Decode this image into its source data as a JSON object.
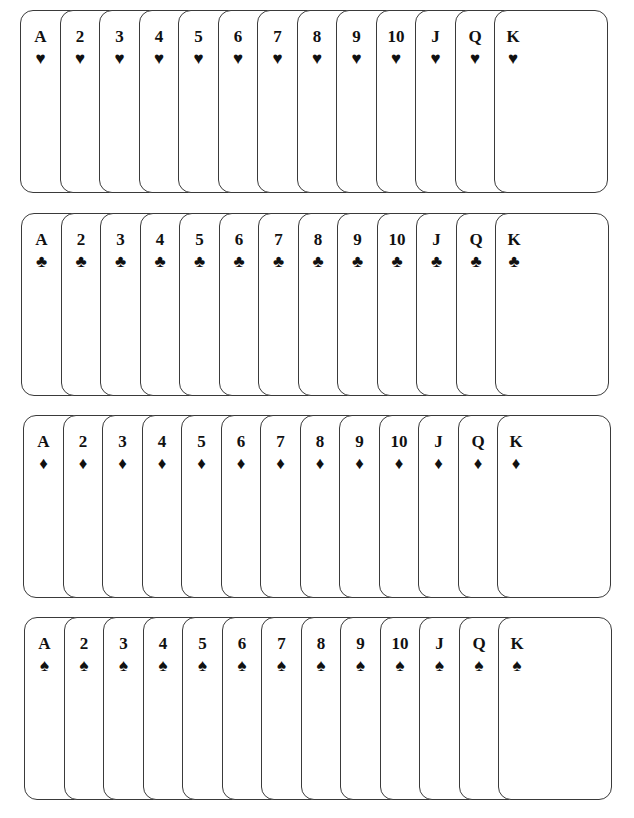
{
  "ranks": [
    "A",
    "2",
    "3",
    "4",
    "5",
    "6",
    "7",
    "8",
    "9",
    "10",
    "J",
    "Q",
    "K"
  ],
  "rows": [
    {
      "suit": "hearts",
      "symbol": "♥",
      "top": 10,
      "left": 20
    },
    {
      "suit": "clubs",
      "symbol": "♣",
      "top": 213,
      "left": 21
    },
    {
      "suit": "diamonds",
      "symbol": "♦",
      "top": 415,
      "left": 23
    },
    {
      "suit": "spades",
      "symbol": "♠",
      "top": 617,
      "left": 24
    }
  ],
  "layout": {
    "card_step": 39.5,
    "card_width": 114,
    "card_height": 183,
    "border_color": "#3a3a3a",
    "ink_color": "#111111"
  }
}
